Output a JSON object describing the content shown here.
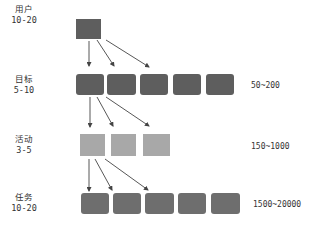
{
  "diagram": {
    "top_text_cutoff": "…………………………",
    "levels": [
      {
        "name": "用户",
        "count": "10-20",
        "range": "",
        "boxes": 1,
        "color": "#5e5e5e"
      },
      {
        "name": "目标",
        "count": "5-10",
        "range": "50~200",
        "boxes": 5,
        "color": "#5e5e5e"
      },
      {
        "name": "活动",
        "count": "3-5",
        "range": "150~1000",
        "boxes": 3,
        "color": "#a8a8a8"
      },
      {
        "name": "任务",
        "count": "10-20",
        "range": "1500~20000",
        "boxes": 5,
        "color": "#6e6e6e"
      }
    ],
    "arrow_color": "#444444"
  }
}
